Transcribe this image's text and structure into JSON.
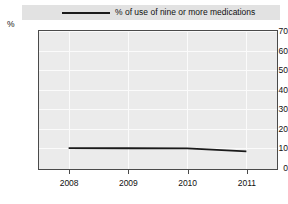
{
  "legend": {
    "entries": [
      {
        "label": "% of use of nine or more medications",
        "color": "#1a1a1a",
        "marker": "line"
      }
    ]
  },
  "axes": {
    "y_unit_label": "%",
    "y_ticks": [
      "70",
      "60",
      "50",
      "40",
      "30",
      "20",
      "10",
      "0"
    ],
    "x_ticks": [
      "2008",
      "2009",
      "2010",
      "2011"
    ]
  },
  "chart_data": {
    "type": "line",
    "title": "",
    "xlabel": "",
    "ylabel": "%",
    "categories": [
      "2008",
      "2009",
      "2010",
      "2011"
    ],
    "x": [
      2008,
      2009,
      2010,
      2011
    ],
    "ylim": [
      0,
      70
    ],
    "ytick_step": 10,
    "grid": true,
    "legend_position": "top",
    "series": [
      {
        "name": "% of use of nine or more medications",
        "color": "#1a1a1a",
        "values": [
          10.2,
          10.1,
          10.0,
          8.5
        ]
      }
    ]
  },
  "colors": {
    "plot_background": "#ebebeb",
    "legend_background": "#e2e2e2",
    "gridline": "#fbfbfb",
    "axis_border": "#4a4a4a",
    "text": "#111111"
  }
}
